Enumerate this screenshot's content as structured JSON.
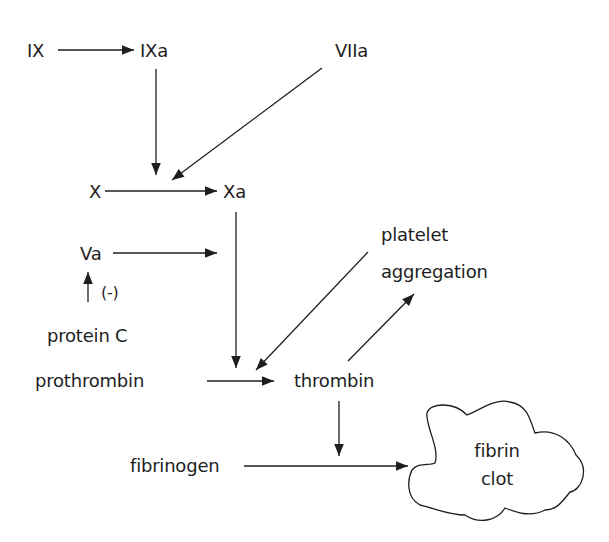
{
  "diagram": {
    "nodes": {
      "ix": "IX",
      "ixa": "IXa",
      "viia": "VIIa",
      "x": "X",
      "xa": "Xa",
      "va": "Va",
      "protein_c": "protein C",
      "inhibit": "(-)",
      "prothrombin": "prothrombin",
      "thrombin": "thrombin",
      "platelet": "platelet",
      "aggregation": "aggregation",
      "fibrinogen": "fibrinogen",
      "fibrin": "fibrin",
      "clot": "clot"
    },
    "edges": [
      {
        "from": "IX",
        "to": "IXa"
      },
      {
        "from": "IXa",
        "to": "X→Xa"
      },
      {
        "from": "VIIa",
        "to": "X→Xa"
      },
      {
        "from": "X",
        "to": "Xa"
      },
      {
        "from": "Va",
        "to": "Xa→thrombin"
      },
      {
        "from": "protein C",
        "to": "Va",
        "label": "(-)"
      },
      {
        "from": "Xa",
        "to": "prothrombin→thrombin"
      },
      {
        "from": "platelet aggregation",
        "to": "prothrombin→thrombin"
      },
      {
        "from": "prothrombin",
        "to": "thrombin"
      },
      {
        "from": "thrombin",
        "to": "platelet aggregation"
      },
      {
        "from": "thrombin",
        "to": "fibrinogen→fibrin clot"
      },
      {
        "from": "fibrinogen",
        "to": "fibrin clot"
      }
    ],
    "colors": {
      "ink": "#1e1e1e",
      "background": "#ffffff"
    }
  }
}
